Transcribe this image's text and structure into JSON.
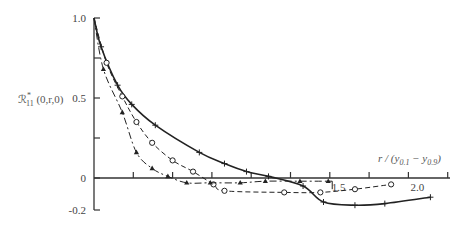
{
  "chart_data": {
    "type": "line",
    "title": "",
    "xlabel": "r / (y_0.1 − y_0.9)",
    "ylabel": "R*_11 (0,r,0)",
    "xlim": [
      0,
      2.3
    ],
    "ylim": [
      -0.2,
      1.0
    ],
    "grid": false,
    "legend": "none",
    "y_ticks": [
      {
        "value": 1.0,
        "label": "1.0"
      },
      {
        "value": 0.75,
        "label": ""
      },
      {
        "value": 0.5,
        "label": "0.5"
      },
      {
        "value": 0.25,
        "label": ""
      },
      {
        "value": 0,
        "label": "0"
      },
      {
        "value": -0.2,
        "label": "-0.2"
      }
    ],
    "x_ticks": [
      {
        "value": 0.25,
        "label": ""
      },
      {
        "value": 0.5,
        "label": ""
      },
      {
        "value": 0.75,
        "label": ""
      },
      {
        "value": 1.0,
        "label": ""
      },
      {
        "value": 1.25,
        "label": ""
      },
      {
        "value": 1.5,
        "label": "1.5"
      },
      {
        "value": 1.75,
        "label": ""
      },
      {
        "value": 2.0,
        "label": "2.0"
      },
      {
        "value": 2.25,
        "label": ""
      }
    ],
    "series": [
      {
        "name": "solid-plus",
        "style": "solid",
        "marker": "plus",
        "x": [
          0,
          0.045,
          0.15,
          0.24,
          0.39,
          0.67,
          0.83,
          0.97,
          1.11,
          1.33,
          1.46,
          1.66,
          1.85,
          2.14
        ],
        "y": [
          1.0,
          0.82,
          0.58,
          0.46,
          0.33,
          0.16,
          0.09,
          0.04,
          0.01,
          -0.05,
          -0.15,
          -0.17,
          -0.16,
          -0.12
        ]
      },
      {
        "name": "dashed-circle",
        "style": "dashed",
        "marker": "circle",
        "x": [
          0,
          0.08,
          0.18,
          0.27,
          0.37,
          0.5,
          0.63,
          0.76,
          0.83,
          1.21,
          1.44,
          1.66,
          1.89
        ],
        "y": [
          1.0,
          0.72,
          0.51,
          0.35,
          0.22,
          0.11,
          0.04,
          -0.04,
          -0.08,
          -0.09,
          -0.09,
          -0.07,
          -0.04
        ]
      },
      {
        "name": "dashdot-triangle",
        "style": "dashdot",
        "marker": "triangle",
        "x": [
          0,
          0.06,
          0.18,
          0.27,
          0.37,
          0.47,
          0.59,
          0.74,
          0.93,
          1.09,
          1.31,
          1.49
        ],
        "y": [
          1.0,
          0.68,
          0.41,
          0.16,
          0.06,
          0.01,
          -0.03,
          -0.03,
          -0.03,
          -0.02,
          -0.02,
          -0.02
        ]
      }
    ]
  },
  "labels": {
    "y_axis_title": "ℛ",
    "y_axis_sup": "*",
    "y_axis_sub": "11",
    "y_axis_args": " (0,r,0)",
    "x_axis_r": "r / (y",
    "x_axis_sub1": "0.1",
    "x_axis_minus": " − y",
    "x_axis_sub2": "0.9",
    "x_axis_close": ")"
  }
}
